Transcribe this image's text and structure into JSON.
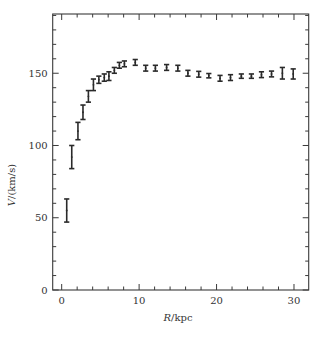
{
  "chart_data": {
    "type": "scatter",
    "title": "",
    "xlabel_italic": "R",
    "xlabel_rest": "/kpc",
    "xlabel": "R/kpc",
    "ylabel_italic": "V",
    "ylabel_rest": "/(km/s)",
    "ylabel": "V/(km/s)",
    "xlim": [
      -1.16,
      31.9
    ],
    "ylim": [
      0,
      191
    ],
    "x_major_ticks": [
      0,
      10,
      20,
      30
    ],
    "x_minor_step": 2,
    "y_major_ticks": [
      0,
      50,
      100,
      150
    ],
    "y_minor_step": 10,
    "grid": false,
    "legend": null,
    "error_bars": true,
    "series": [
      {
        "name": "rotation curve",
        "points": [
          {
            "x": 0.65,
            "y": 55,
            "err": 8
          },
          {
            "x": 1.3,
            "y": 92,
            "err": 8
          },
          {
            "x": 2.1,
            "y": 110,
            "err": 6
          },
          {
            "x": 2.75,
            "y": 123,
            "err": 5
          },
          {
            "x": 3.45,
            "y": 134,
            "err": 4
          },
          {
            "x": 4.1,
            "y": 142,
            "err": 4
          },
          {
            "x": 4.8,
            "y": 145.5,
            "err": 2.5
          },
          {
            "x": 5.5,
            "y": 147,
            "err": 2.5
          },
          {
            "x": 6.1,
            "y": 148,
            "err": 3
          },
          {
            "x": 6.8,
            "y": 152,
            "err": 2
          },
          {
            "x": 7.45,
            "y": 155.5,
            "err": 2
          },
          {
            "x": 8.1,
            "y": 156.5,
            "err": 2
          },
          {
            "x": 9.5,
            "y": 157.5,
            "err": 2
          },
          {
            "x": 10.85,
            "y": 153.5,
            "err": 2
          },
          {
            "x": 12.1,
            "y": 153.5,
            "err": 2
          },
          {
            "x": 13.55,
            "y": 154,
            "err": 2
          },
          {
            "x": 15.0,
            "y": 153.5,
            "err": 2
          },
          {
            "x": 16.3,
            "y": 150,
            "err": 2
          },
          {
            "x": 17.7,
            "y": 149.3,
            "err": 2
          },
          {
            "x": 19.0,
            "y": 148.3,
            "err": 1.5
          },
          {
            "x": 20.45,
            "y": 146.5,
            "err": 2
          },
          {
            "x": 21.8,
            "y": 147,
            "err": 2
          },
          {
            "x": 23.2,
            "y": 148,
            "err": 1.5
          },
          {
            "x": 24.5,
            "y": 148,
            "err": 1.5
          },
          {
            "x": 25.8,
            "y": 149,
            "err": 2
          },
          {
            "x": 27.1,
            "y": 149.5,
            "err": 2
          },
          {
            "x": 28.5,
            "y": 150,
            "err": 4
          },
          {
            "x": 29.9,
            "y": 149.5,
            "err": 3.5
          }
        ]
      }
    ]
  },
  "layout": {
    "width": 320,
    "height": 337,
    "plot_left": 52.7,
    "plot_right": 308.7,
    "plot_top": 14,
    "plot_bottom": 290,
    "axis_color": "#3a3a3a",
    "marker_color": "#2a2a2a"
  }
}
